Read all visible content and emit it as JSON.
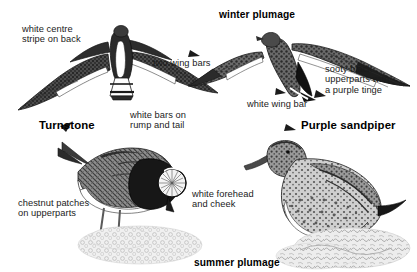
{
  "plate": {
    "title_hidden": "",
    "background_color": "#ffffff",
    "ink_color": "#1b1b1b"
  },
  "labels": {
    "white_centre_stripe": "white centre\nstripe on back",
    "two_wing_bars": "two wing bars",
    "winter_plumage": "winter plumage",
    "sooty_black": "sooty black\nupperparts with\na purple tinge",
    "white_wing_bar": "white wing bar",
    "white_bars_rump": "white bars on\nrump and tail",
    "turnstone": "Turnstone",
    "purple_sandpiper": "Purple sandpiper",
    "chestnut_patches": "chestnut patches\non upperparts",
    "white_forehead": "white forehead\nand cheek",
    "summer_plumage": "summer plumage"
  },
  "illustrations": {
    "flying_turnstone": "flying-turnstone-dorsal-winter",
    "flying_purple_sandpiper": "flying-purple-sandpiper-dorsal-winter",
    "standing_turnstone": "standing-turnstone-summer",
    "standing_purple_sandpiper": "standing-purple-sandpiper-summer",
    "ground_turnstone": "pebble-ground-patch",
    "ground_purple_sandpiper": "seaweed-rock-patch"
  }
}
